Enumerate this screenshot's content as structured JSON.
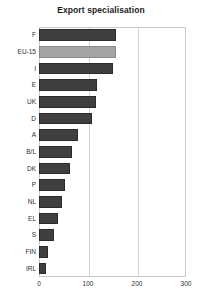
{
  "chart_data": {
    "type": "bar",
    "orientation": "horizontal",
    "title": "Export specialisation",
    "xlabel": "",
    "ylabel": "",
    "categories": [
      "F",
      "EU-15",
      "I",
      "E",
      "UK",
      "D",
      "A",
      "B/L",
      "DK",
      "P",
      "NL",
      "EL",
      "S",
      "FIN",
      "IRL"
    ],
    "values": [
      157,
      157,
      151,
      118,
      116,
      108,
      80,
      67,
      63,
      53,
      47,
      39,
      31,
      19,
      14
    ],
    "series": [
      {
        "name": "Export specialisation",
        "values": [
          157,
          157,
          151,
          118,
          116,
          108,
          80,
          67,
          63,
          53,
          47,
          39,
          31,
          19,
          14
        ]
      }
    ],
    "highlight_category": "EU-15",
    "xlim": [
      0,
      300
    ],
    "xticks": [
      0,
      100,
      200,
      300
    ],
    "xtick_labels": [
      "0",
      "100",
      "200",
      "300"
    ],
    "grid": "vertical",
    "legend": "none",
    "colors": {
      "bar": "#3f3f3f",
      "bar_highlight": "#a3a3a3",
      "gridline": "#d2d2d2",
      "frame": "#c8c8c8",
      "text": "#2e2e2e",
      "title": "#1c1c1c",
      "background": "#ffffff"
    }
  }
}
